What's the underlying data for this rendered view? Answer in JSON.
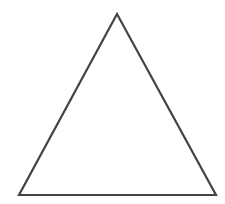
{
  "canvas": {
    "width": 225,
    "height": 204,
    "background": "#ffffff"
  },
  "shape": {
    "type": "triangle",
    "vertices": [
      {
        "x": 117,
        "y": 14
      },
      {
        "x": 19,
        "y": 195
      },
      {
        "x": 216,
        "y": 195
      }
    ],
    "stroke": "#444444",
    "stroke_width": 2.2,
    "fill": "none"
  }
}
